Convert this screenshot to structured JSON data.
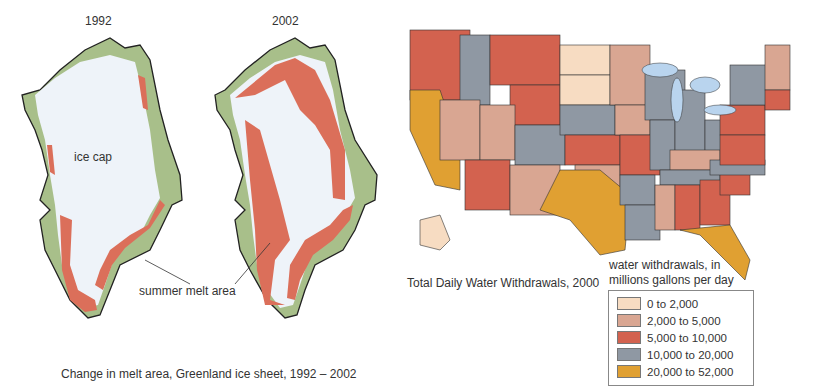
{
  "greenland": {
    "year_1992": "1992",
    "year_2002": "2002",
    "ice_cap_label": "ice cap",
    "melt_label": "summer melt area",
    "caption": "Change in melt area, Greenland ice sheet, 1992 – 2002",
    "colors": {
      "land": "#a8bf8a",
      "ice": "#eef3f9",
      "ice_shade": "#c9d8ea",
      "melt": "#db6f5a"
    }
  },
  "us_map": {
    "title": "Total Daily Water Withdrawals, 2000",
    "legend_title_line1": "water withdrawals, in",
    "legend_title_line2": "millions gallons per day",
    "legend": [
      {
        "label": "0 to 2,000",
        "color": "#f7dcc2"
      },
      {
        "label": "2,000 to 5,000",
        "color": "#d9a692"
      },
      {
        "label": "5,000 to 10,000",
        "color": "#d3624f"
      },
      {
        "label": "10,000 to 20,000",
        "color": "#8f98a3"
      },
      {
        "label": "20,000 to 52,000",
        "color": "#e0a032"
      }
    ],
    "lakes_color": "#b9d4ee"
  }
}
